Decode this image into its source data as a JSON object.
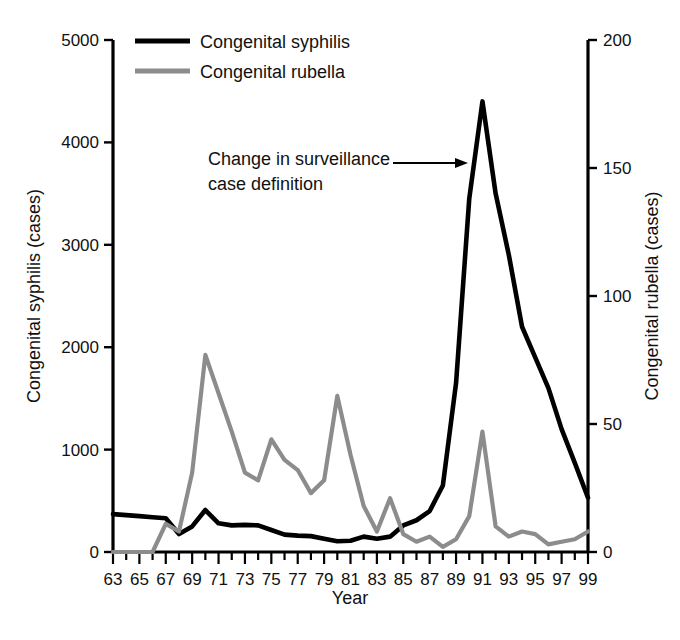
{
  "chart_data": {
    "type": "line",
    "title": "",
    "subtitle": "",
    "xlabel": "Year",
    "ylabel": "Congenital syphilis (cases)",
    "y2label": "Congenital rubella (cases)",
    "xlim": [
      63,
      99
    ],
    "ylim": [
      0,
      5000
    ],
    "y2lim": [
      0,
      200
    ],
    "grid": false,
    "legend_position": "top-left",
    "x_tick_labels": [
      "63",
      "65",
      "67",
      "69",
      "71",
      "73",
      "75",
      "77",
      "79",
      "81",
      "83",
      "85",
      "87",
      "89",
      "91",
      "93",
      "95",
      "97",
      "99"
    ],
    "x_tick_values": [
      63,
      65,
      67,
      69,
      71,
      73,
      75,
      77,
      79,
      81,
      83,
      85,
      87,
      89,
      91,
      93,
      95,
      97,
      99
    ],
    "x_minor_ticks_every": 1,
    "y_tick_labels": [
      "0",
      "1000",
      "2000",
      "3000",
      "4000",
      "5000"
    ],
    "y_tick_values": [
      0,
      1000,
      2000,
      3000,
      4000,
      5000
    ],
    "y2_tick_labels": [
      "0",
      "50",
      "100",
      "150",
      "200"
    ],
    "y2_tick_values": [
      0,
      50,
      100,
      150,
      200
    ],
    "x": [
      63,
      64,
      65,
      66,
      67,
      68,
      69,
      70,
      71,
      72,
      73,
      74,
      75,
      76,
      77,
      78,
      79,
      80,
      81,
      82,
      83,
      84,
      85,
      86,
      87,
      88,
      89,
      90,
      91,
      92,
      93,
      94,
      95,
      96,
      97,
      98,
      99
    ],
    "series": [
      {
        "name": "Congenital syphilis",
        "axis": "left",
        "color": "#000000",
        "values": [
          370,
          360,
          350,
          340,
          330,
          175,
          250,
          410,
          280,
          260,
          265,
          260,
          215,
          170,
          160,
          155,
          130,
          105,
          110,
          150,
          130,
          150,
          260,
          310,
          400,
          650,
          1650,
          3450,
          4400,
          3500,
          2900,
          2200,
          1900,
          1600,
          1200,
          870,
          530
        ]
      },
      {
        "name": "Congenital rubella",
        "axis": "right",
        "color": "#8c8c8c",
        "values": [
          0,
          0,
          0,
          0,
          11,
          8,
          31,
          77,
          62,
          47,
          31,
          28,
          44,
          36,
          32,
          23,
          28,
          61,
          38,
          18,
          8,
          21,
          7,
          4,
          6,
          2,
          5,
          14,
          47,
          10,
          6,
          8,
          7,
          3,
          4,
          5,
          8
        ]
      }
    ],
    "annotations": [
      {
        "text_line_1": "Change in surveillance",
        "text_line_2": "case definition",
        "arrow_points_to_year": 90.2,
        "arrow_points_to_value": 3820
      }
    ]
  },
  "legend": {
    "items": [
      {
        "label": "Congenital syphilis",
        "color": "#000000"
      },
      {
        "label": "Congenital rubella",
        "color": "#8c8c8c"
      }
    ]
  }
}
